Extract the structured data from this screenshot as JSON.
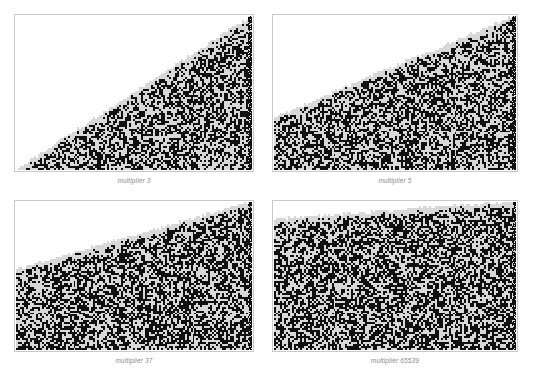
{
  "figure": {
    "background_color": "#ffffff",
    "panel_border_color": "#c9c9c9",
    "panel_fill_color": "#ffffff",
    "noise_dark_color": "#101010",
    "noise_light_color": "#d8d8d8",
    "caption_color": "#8a8a8a",
    "layout": "2x2-grid",
    "panel_count": 4
  },
  "panels": [
    {
      "id": "panel-multiplier-3",
      "caption": "multiplier 3",
      "multiplier": 3,
      "left": 14,
      "top": 14,
      "width": 240,
      "height": 158,
      "caption_top": 177,
      "fill_left_fraction": 1.0,
      "fill_right_fraction": 0.0,
      "density": 0.5,
      "cell": 2,
      "seed": 3,
      "edge_band_fraction": 0.018
    },
    {
      "id": "panel-multiplier-5",
      "caption": "multiplier 5",
      "multiplier": 5,
      "left": 272,
      "top": 14,
      "width": 246,
      "height": 158,
      "caption_top": 177,
      "fill_left_fraction": 0.66,
      "fill_right_fraction": 0.0,
      "density": 0.52,
      "cell": 2,
      "seed": 5,
      "edge_band_fraction": 0.016
    },
    {
      "id": "panel-multiplier-37",
      "caption": "multiplier 37",
      "multiplier": 37,
      "left": 14,
      "top": 200,
      "width": 240,
      "height": 152,
      "caption_top": 357,
      "fill_left_fraction": 0.46,
      "fill_right_fraction": 0.0,
      "density": 0.54,
      "cell": 2,
      "seed": 37,
      "edge_band_fraction": 0.014
    },
    {
      "id": "panel-multiplier-65539",
      "caption": "multiplier 65539",
      "multiplier": 65539,
      "left": 272,
      "top": 200,
      "width": 246,
      "height": 152,
      "caption_top": 357,
      "fill_left_fraction": 0.12,
      "fill_right_fraction": 0.0,
      "density": 0.55,
      "cell": 2,
      "seed": 65539,
      "edge_band_fraction": 0.012
    }
  ]
}
